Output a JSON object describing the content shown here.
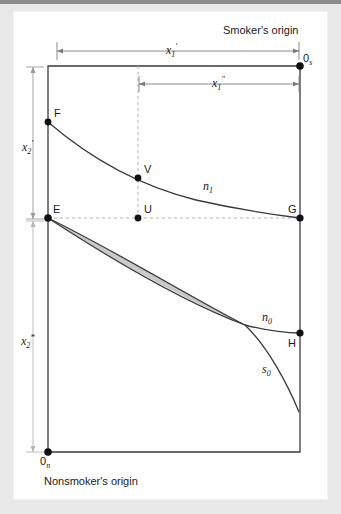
{
  "figure": {
    "title_top": "Smoker's origin",
    "title_bottom": "Nonsmoker's origin",
    "background_color": "#e8e8e8",
    "panel_color": "#ffffff",
    "line_color": "#333333",
    "lens_fill": "#c9c9c9",
    "dash_color": "#aaaaaa"
  },
  "axes": {
    "dimension_labels": [
      {
        "id": "x1-prime",
        "text": "x",
        "subscript": "1",
        "prime": "′",
        "role": "horizontal-top-outer"
      },
      {
        "id": "x1-double",
        "text": "x",
        "subscript": "1",
        "prime": "″",
        "role": "horizontal-top-inner"
      },
      {
        "id": "x2-prime",
        "text": "x",
        "subscript": "2",
        "prime": "′",
        "role": "vertical-left-upper"
      },
      {
        "id": "x2-star",
        "text": "x",
        "subscript": "2",
        "prime": "*",
        "role": "vertical-left-lower"
      }
    ]
  },
  "origins": {
    "smoker": {
      "symbol": "0",
      "subscript": "s",
      "caption": "Smoker's origin"
    },
    "nonsmoker": {
      "symbol": "0",
      "subscript": "n",
      "caption": "Nonsmoker's origin"
    }
  },
  "points": [
    {
      "name": "F",
      "label": "F",
      "x": 48,
      "y": 122
    },
    {
      "name": "V",
      "label": "V",
      "x": 138,
      "y": 178
    },
    {
      "name": "E",
      "label": "E",
      "x": 48,
      "y": 218
    },
    {
      "name": "U",
      "label": "U",
      "x": 138,
      "y": 218
    },
    {
      "name": "G",
      "label": "G",
      "x": 300,
      "y": 218
    },
    {
      "name": "H",
      "label": "H",
      "x": 300,
      "y": 333
    },
    {
      "name": "Os",
      "label": "0",
      "x": 300,
      "y": 66
    },
    {
      "name": "On",
      "label": "0",
      "x": 48,
      "y": 452
    }
  ],
  "curves": [
    {
      "id": "n1",
      "label": "n",
      "subscript": "1",
      "desc": "upper indifference curve from F to G"
    },
    {
      "id": "n0",
      "label": "n",
      "subscript": "0",
      "desc": "lower indifference curve from E to H"
    },
    {
      "id": "s0",
      "label": "s",
      "subscript": "0",
      "desc": "smoker indifference curve from E through crossing downward"
    }
  ],
  "shaded_region": {
    "name": "lens-of-mutual-gain",
    "endpoints": [
      "E",
      "crossing"
    ],
    "fill": "#c9c9c9"
  }
}
